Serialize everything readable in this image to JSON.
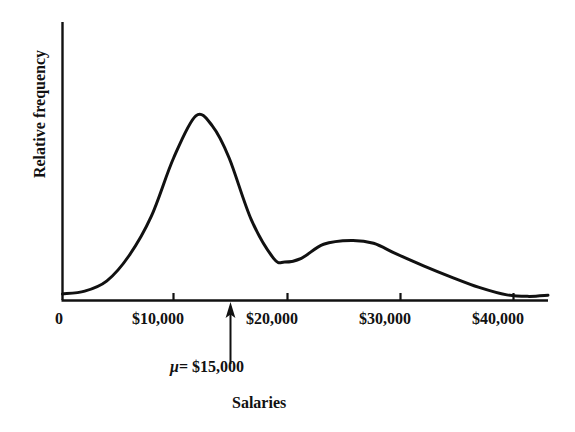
{
  "chart_data": {
    "type": "line",
    "title": "",
    "subtitle": "",
    "xlabel": "Salaries",
    "ylabel": "Relative frequency",
    "xlim": [
      0,
      43700
    ],
    "ylim": [
      0,
      1.0
    ],
    "grid": false,
    "legend": null,
    "x_ticks": [
      {
        "value": 0,
        "label": "0",
        "px": 62
      },
      {
        "value": 10000,
        "label": "$10,000",
        "px": 173
      },
      {
        "value": 20000,
        "label": "$20,000",
        "px": 287
      },
      {
        "value": 30000,
        "label": "$30,000",
        "px": 400
      },
      {
        "value": 40000,
        "label": "$40,000",
        "px": 513
      }
    ],
    "y_ticks": [],
    "series": [
      {
        "name": "Relative frequency of salaries",
        "shape": "bimodal density curve",
        "points": [
          {
            "x": 0,
            "y": 0.035
          },
          {
            "x": 2000,
            "y": 0.05
          },
          {
            "x": 4000,
            "y": 0.105
          },
          {
            "x": 6000,
            "y": 0.24
          },
          {
            "x": 8000,
            "y": 0.45
          },
          {
            "x": 10000,
            "y": 0.76
          },
          {
            "x": 12000,
            "y": 0.985
          },
          {
            "x": 13500,
            "y": 0.93
          },
          {
            "x": 15000,
            "y": 0.76
          },
          {
            "x": 17000,
            "y": 0.43
          },
          {
            "x": 19000,
            "y": 0.225
          },
          {
            "x": 20000,
            "y": 0.205
          },
          {
            "x": 21500,
            "y": 0.225
          },
          {
            "x": 23500,
            "y": 0.3
          },
          {
            "x": 26000,
            "y": 0.32
          },
          {
            "x": 28000,
            "y": 0.305
          },
          {
            "x": 30000,
            "y": 0.25
          },
          {
            "x": 32500,
            "y": 0.185
          },
          {
            "x": 35000,
            "y": 0.125
          },
          {
            "x": 37500,
            "y": 0.07
          },
          {
            "x": 40000,
            "y": 0.03
          },
          {
            "x": 42000,
            "y": 0.022
          },
          {
            "x": 43700,
            "y": 0.028
          }
        ],
        "peaks": [
          {
            "x": 12000,
            "y": 0.985,
            "label": "primary mode"
          },
          {
            "x": 26200,
            "y": 0.32,
            "label": "secondary mode"
          }
        ],
        "valley": {
          "x": 20100,
          "y": 0.203
        }
      }
    ],
    "annotations": [
      {
        "type": "arrow-up",
        "text": "μ = $15,000",
        "mu_symbol": "μ",
        "equals": "=",
        "value": "$15,000",
        "x_value": 15000,
        "x_px": 230,
        "arrow_tip_y_px": 303,
        "arrow_tail_y_px": 364
      }
    ],
    "colors": {
      "curve": "#111111",
      "axis": "#111111",
      "text": "#111111",
      "background": "#ffffff"
    }
  },
  "axes": {
    "y_axis_label": "Relative frequency",
    "x_axis_label": "Salaries"
  },
  "annotation": {
    "mu_symbol": "μ",
    "mu_text": "= $15,000",
    "full": "μ = $15,000"
  },
  "ticks": {
    "t0": "0",
    "t1": "$10,000",
    "t2": "$20,000",
    "t3": "$30,000",
    "t4": "$40,000"
  }
}
